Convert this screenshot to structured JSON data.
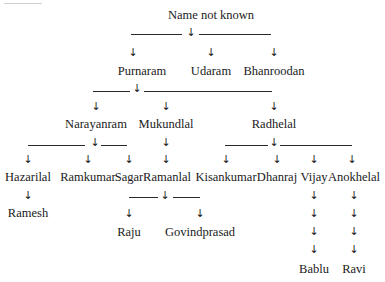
{
  "diagram": {
    "type": "family-tree",
    "root": {
      "name": "Name not known",
      "children": [
        {
          "name": "Purnaram",
          "children": [
            {
              "name": "Narayanram",
              "children": [
                {
                  "name": "Hazarilal",
                  "children": [
                    {
                      "name": "Ramesh"
                    }
                  ]
                },
                {
                  "name": "Ramkumar"
                },
                {
                  "name": "Sagar"
                }
              ]
            },
            {
              "name": "Mukundlal",
              "children": [
                {
                  "name": "Ramanlal",
                  "children": [
                    {
                      "name": "Raju"
                    },
                    {
                      "name": "Govindprasad"
                    }
                  ]
                }
              ]
            },
            {
              "name": "Radhelal",
              "children": [
                {
                  "name": "Kisankumar"
                },
                {
                  "name": "Dhanraj"
                },
                {
                  "name": "Vijay",
                  "children": [
                    {
                      "name": "Bablu"
                    }
                  ]
                },
                {
                  "name": "Anokhelal",
                  "children": [
                    {
                      "name": "Ravi"
                    }
                  ]
                }
              ]
            }
          ]
        },
        {
          "name": "Udaram"
        },
        {
          "name": "Bhanroodan"
        }
      ]
    }
  },
  "labels": {
    "root": "Name not known",
    "purnaram": "Purnaram",
    "udaram": "Udaram",
    "bhanroodan": "Bhanroodan",
    "narayanram": "Narayanram",
    "mukundlal": "Mukundlal",
    "radhelal": "Radhelal",
    "hazarilal": "Hazarilal",
    "ramkumar": "Ramkumar",
    "sagar": "Sagar",
    "ramanlal": "Ramanlal",
    "kisankumar": "Kisankumar",
    "dhanraj": "Dhanraj",
    "vijay": "Vijay",
    "anokhelal": "Anokhelal",
    "ramesh": "Ramesh",
    "raju": "Raju",
    "govindprasad": "Govindprasad",
    "bablu": "Bablu",
    "ravi": "Ravi"
  },
  "symbols": {
    "arrow": "↓"
  }
}
